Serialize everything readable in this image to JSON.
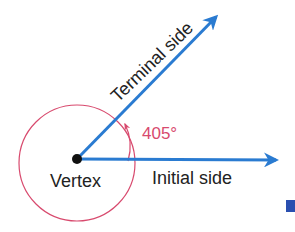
{
  "diagram": {
    "labels": {
      "terminal_side": "Terminal side",
      "initial_side": "Initial side",
      "vertex": "Vertex",
      "angle": "405°"
    },
    "angle_degrees": 405,
    "colors": {
      "ray": "#2a7bd1",
      "circle": "#d84a6e",
      "angle_label": "#d84a6e",
      "vertex": "#111111",
      "text": "#222222",
      "corner_mark": "#2a4fb0"
    }
  }
}
